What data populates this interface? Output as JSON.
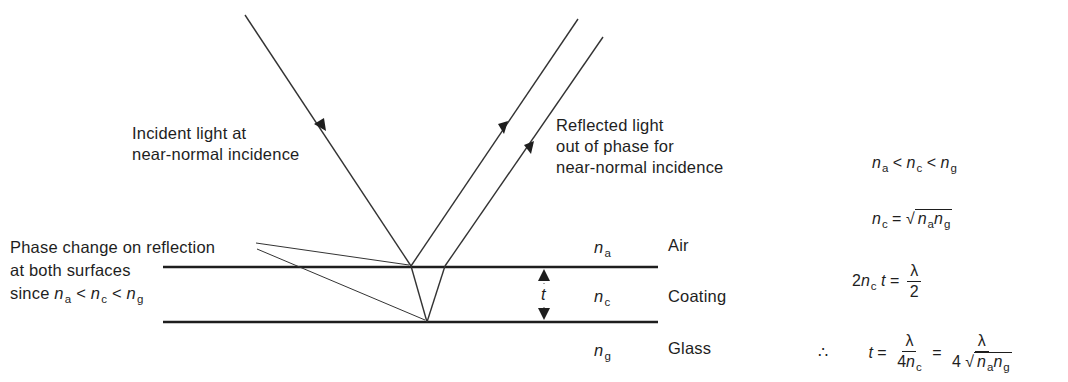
{
  "figure": {
    "labels": {
      "incident": [
        "Incident light at",
        "near-normal incidence"
      ],
      "reflected": [
        "Reflected light",
        "out of phase for",
        "near-normal incidence"
      ],
      "phase_change": [
        "Phase change on reflection",
        "at both surfaces",
        "since"
      ],
      "thickness": "t"
    },
    "layers": [
      {
        "symbol": "n",
        "sub": "a",
        "name": "Air"
      },
      {
        "symbol": "n",
        "sub": "c",
        "name": "Coating"
      },
      {
        "symbol": "n",
        "sub": "g",
        "name": "Glass"
      }
    ],
    "inequality": {
      "n": "n",
      "a": "a",
      "c": "c",
      "g": "g",
      "lt": "<"
    },
    "equations": {
      "eq1": {
        "a": "a",
        "c": "c",
        "g": "g",
        "lt": "<"
      },
      "eq2": {
        "lhs_sub": "c",
        "eq": "=",
        "a": "a",
        "g": "g"
      },
      "eq3": {
        "coef": "2",
        "sub": "c",
        "t": "t",
        "eq": "=",
        "num": "λ",
        "den": "2"
      },
      "eq4": {
        "therefore": "∴",
        "t": "t",
        "eq": "=",
        "num1": "λ",
        "den1_coef": "4",
        "den1_sub": "c",
        "eq2": "=",
        "num2": "λ",
        "den2_coef": "4",
        "a": "a",
        "g": "g"
      }
    },
    "colors": {
      "ink": "#1e1e1e",
      "background": "#ffffff"
    }
  }
}
